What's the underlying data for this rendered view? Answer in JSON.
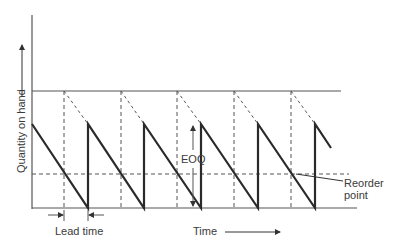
{
  "diagram": {
    "type": "EOQ inventory sawtooth model",
    "y_axis_label": "Quantity on hand",
    "x_axis_label": "Time",
    "eoq_label": "EOQ",
    "lead_time_label": "Lead time",
    "reorder_point_label_line1": "Reorder",
    "reorder_point_label_line2": "point",
    "colors": {
      "line": "#2a2a2a",
      "axis": "#555555",
      "dashed": "#555555",
      "text": "#3a3a3a"
    }
  }
}
